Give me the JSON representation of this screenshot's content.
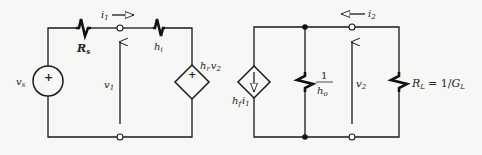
{
  "diagram": {
    "input_port": {
      "source": {
        "name": "v",
        "sub": "s",
        "polarity": "+"
      },
      "series_resistor": {
        "name": "R",
        "sub": "s"
      },
      "input_current": {
        "name": "i",
        "sub": "1"
      },
      "input_voltage": {
        "name": "v",
        "sub": "1"
      },
      "input_resistor": {
        "name": "h",
        "sub": "i"
      },
      "dependent_voltage_source": {
        "coef": "h",
        "coef_sub": "r",
        "var": "v",
        "var_sub": "2",
        "polarity": "+"
      }
    },
    "output_port": {
      "dependent_current_source": {
        "coef": "h",
        "coef_sub": "f",
        "var": "i",
        "var_sub": "1"
      },
      "output_conductance": {
        "numerator": "1",
        "denominator": "h",
        "denominator_sub": "o"
      },
      "output_current": {
        "name": "i",
        "sub": "2"
      },
      "output_voltage": {
        "name": "v",
        "sub": "2"
      },
      "load": {
        "name": "R",
        "sub": "L",
        "equals": "= 1/",
        "g": "G",
        "g_sub": "L"
      }
    }
  }
}
